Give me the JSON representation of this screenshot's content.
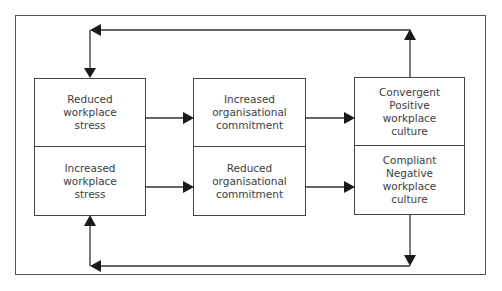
{
  "diagram": {
    "columns": [
      {
        "id": "stress",
        "top": {
          "label": "Reduced workplace\nstress"
        },
        "bottom": {
          "label": "Increased workplace\nstress"
        }
      },
      {
        "id": "commitment",
        "top": {
          "label": "Increased\norganisational\ncommitment"
        },
        "bottom": {
          "label": "Reduced organisational\ncommitment"
        }
      },
      {
        "id": "culture",
        "top": {
          "label": "Convergent\nPositive workplace\nculture"
        },
        "bottom": {
          "label": "Compliant\nNegative workplace\nculture"
        }
      }
    ],
    "edges": [
      {
        "from": "Reduced workplace stress",
        "to": "Increased organisational commitment"
      },
      {
        "from": "Increased workplace stress",
        "to": "Reduced organisational commitment"
      },
      {
        "from": "Increased organisational commitment",
        "to": "Convergent Positive workplace culture"
      },
      {
        "from": "Reduced organisational commitment",
        "to": "Compliant Negative workplace culture"
      },
      {
        "from": "Convergent Positive workplace culture",
        "to": "Reduced workplace stress",
        "type": "feedback-top"
      },
      {
        "from": "Compliant Negative workplace culture",
        "to": "Increased workplace stress",
        "type": "feedback-bottom"
      }
    ],
    "colors": {
      "line": "#444444",
      "text": "#3d3d3d",
      "background": "#ffffff"
    }
  }
}
